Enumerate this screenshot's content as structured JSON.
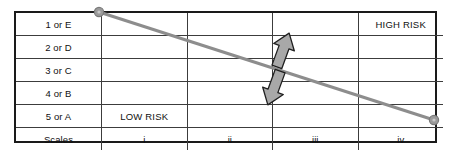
{
  "diagram": {
    "rows": [
      {
        "label": "1 or E",
        "cells": [
          "",
          "",
          "",
          "HIGH RISK"
        ]
      },
      {
        "label": "2 or D",
        "cells": [
          "",
          "",
          "",
          ""
        ]
      },
      {
        "label": "3 or C",
        "cells": [
          "",
          "",
          "",
          ""
        ]
      },
      {
        "label": "4 or B",
        "cells": [
          "",
          "",
          "",
          ""
        ]
      },
      {
        "label": "5 or A",
        "cells": [
          "LOW RISK",
          "",
          "",
          ""
        ]
      },
      {
        "label": "Scales",
        "cells": [
          "i",
          "ii",
          "iii",
          "iv"
        ]
      }
    ],
    "annotations": {
      "high_risk": "HIGH RISK",
      "low_risk": "LOW RISK",
      "trend_line": {
        "name": "risk-trend-line",
        "from": {
          "x": 99,
          "y": 12
        },
        "to": {
          "x": 434,
          "y": 120
        },
        "color": "#8d8d8d",
        "endpoint_marker": "circle"
      },
      "arrow_up": {
        "name": "up-arrow",
        "color": "#a6a6a6",
        "direction": "up-right"
      },
      "arrow_down": {
        "name": "down-arrow",
        "color": "#a6a6a6",
        "direction": "down-left"
      }
    },
    "colors": {
      "border": "#1a1a1a",
      "grid": "#3c3c3c",
      "line": "#8d8d8d",
      "arrow_fill": "#a6a6a6",
      "arrow_stroke": "#1a1a1a",
      "text": "#111111",
      "background": "#ffffff"
    }
  }
}
